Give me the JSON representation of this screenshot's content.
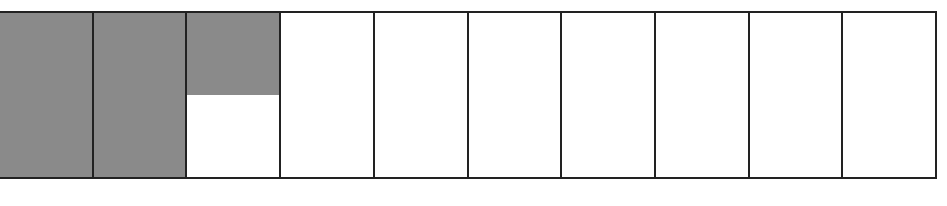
{
  "diagram": {
    "type": "fraction-strip",
    "cells_total": 10,
    "cells": [
      {
        "fill": 1.0
      },
      {
        "fill": 1.0
      },
      {
        "fill": 0.5
      },
      {
        "fill": 0
      },
      {
        "fill": 0
      },
      {
        "fill": 0
      },
      {
        "fill": 0
      },
      {
        "fill": 0
      },
      {
        "fill": 0
      },
      {
        "fill": 0
      }
    ],
    "shaded_amount": 2.5,
    "colors": {
      "shade": "#8a8a8a",
      "border": "#222222",
      "background": "#ffffff"
    }
  }
}
